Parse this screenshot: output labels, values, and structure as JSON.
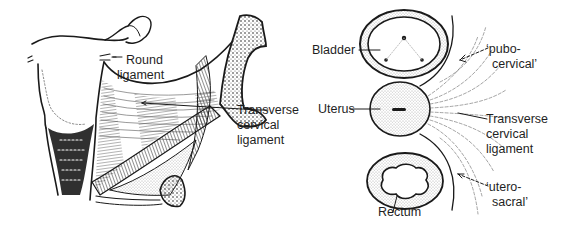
{
  "figure": {
    "panels": [
      {
        "id": "left",
        "description": "Coronal view of uterus and pelvic side wall",
        "labels": {
          "round_ligament_1": "Round",
          "round_ligament_2": "ligament",
          "tcl_1": "Transverse",
          "tcl_2": "cervical",
          "tcl_3": "ligament"
        }
      },
      {
        "id": "right",
        "description": "Transverse section showing bladder, uterus, rectum and cervical ligaments",
        "labels": {
          "bladder": "Bladder",
          "uterus": "Uterus",
          "rectum": "Rectum",
          "pubo_1": "‘pubo-",
          "pubo_2": "cervical’",
          "tcl_1": "Transverse",
          "tcl_2": "cervical",
          "tcl_3": "ligament",
          "utero_1": "‘utero-",
          "utero_2": "sacral’"
        }
      }
    ],
    "colors": {
      "ink": "#1a1a1a",
      "background": "#ffffff"
    }
  }
}
